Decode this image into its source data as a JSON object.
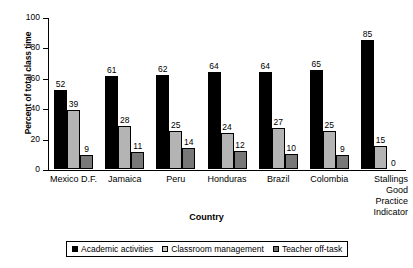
{
  "chart_data": {
    "type": "bar",
    "title": "",
    "xlabel": "Country",
    "ylabel": "Percent of total class time",
    "ylim": [
      0,
      100
    ],
    "yticks": [
      0,
      20,
      40,
      60,
      80,
      100
    ],
    "grid": false,
    "legend_position": "bottom",
    "categories": [
      "Mexico D.F.",
      "Jamaica",
      "Peru",
      "Honduras",
      "Brazil",
      "Colombia",
      "Stallings Good Practice Indicator"
    ],
    "category_lines": [
      [
        "Mexico D.F."
      ],
      [
        "Jamaica"
      ],
      [
        "Peru"
      ],
      [
        "Honduras"
      ],
      [
        "Brazil"
      ],
      [
        "Colombia"
      ],
      [
        "Stallings",
        "Good",
        "Practice",
        "Indicator"
      ]
    ],
    "series": [
      {
        "name": "Academic activities",
        "color": "#000000",
        "values": [
          52,
          61,
          62,
          64,
          64,
          65,
          85
        ]
      },
      {
        "name": "Classroom management",
        "color": "#b4b4b4",
        "values": [
          39,
          28,
          25,
          24,
          27,
          25,
          15
        ]
      },
      {
        "name": "Teacher off-task",
        "color": "#787878",
        "values": [
          9,
          11,
          14,
          12,
          10,
          9,
          0
        ]
      }
    ]
  }
}
